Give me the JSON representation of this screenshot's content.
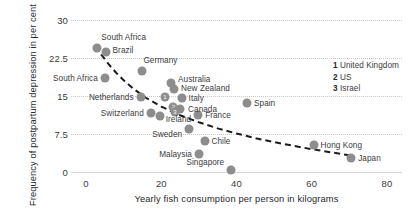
{
  "chart_data": {
    "type": "scatter",
    "title": "",
    "xlabel": "Yearly fish consumption per person in kilograms",
    "ylabel": "Frequency of postpartum depression in per cent",
    "xlim": [
      -4,
      84
    ],
    "ylim": [
      0,
      30
    ],
    "xticks": [
      "0",
      "20",
      "40",
      "60",
      "80"
    ],
    "xtick_values": [
      0,
      20,
      40,
      60,
      80
    ],
    "yticks": [
      "0",
      "7.5",
      "15",
      "22.5",
      "30"
    ],
    "ytick_values": [
      0,
      7.5,
      15,
      22.5,
      30
    ],
    "grid": true,
    "legend_position": "right",
    "points": [
      {
        "label": "South Africa",
        "x": 3.0,
        "y": 24.5,
        "label_side": "right",
        "label_dx": 4,
        "label_dy": -11
      },
      {
        "label": "Brazil",
        "x": 5.2,
        "y": 23.6,
        "label_side": "right",
        "label_dx": 7,
        "label_dy": -2
      },
      {
        "label": "South Africa",
        "x": 5.0,
        "y": 18.6,
        "label_side": "left",
        "label_dx": -7,
        "label_dy": 0
      },
      {
        "label": "Germany",
        "x": 15.0,
        "y": 20.0,
        "label_side": "right",
        "label_dx": 1,
        "label_dy": -11
      },
      {
        "label": "Netherlands",
        "x": 14.5,
        "y": 14.8,
        "label_side": "left",
        "label_dx": -7,
        "label_dy": 0
      },
      {
        "label": "Switzerland",
        "x": 17.2,
        "y": 11.6,
        "label_side": "left",
        "label_dx": -7,
        "label_dy": 0
      },
      {
        "label": "Ireland",
        "x": 19.6,
        "y": 11.0,
        "label_side": "right",
        "label_dx": 6,
        "label_dy": 3
      },
      {
        "label": "Australia",
        "x": 22.6,
        "y": 17.6,
        "label_side": "right",
        "label_dx": 7,
        "label_dy": -4
      },
      {
        "label": "New Zealand",
        "x": 23.4,
        "y": 16.4,
        "label_side": "right",
        "label_dx": 7,
        "label_dy": -1
      },
      {
        "label": "Italy",
        "x": 25.4,
        "y": 14.7,
        "label_side": "right",
        "label_dx": 7,
        "label_dy": 0
      },
      {
        "label": "Canada",
        "x": 25.0,
        "y": 12.4,
        "label_side": "right",
        "label_dx": 8,
        "label_dy": 0
      },
      {
        "label": "France",
        "x": 29.8,
        "y": 11.2,
        "label_side": "right",
        "label_dx": 7,
        "label_dy": 0
      },
      {
        "label": "Sweden",
        "x": 27.4,
        "y": 8.4,
        "label_side": "left",
        "label_dx": -7,
        "label_dy": 5
      },
      {
        "label": "Chile",
        "x": 31.5,
        "y": 6.2,
        "label_side": "right",
        "label_dx": 7,
        "label_dy": 0
      },
      {
        "label": "Malaysia",
        "x": 30.0,
        "y": 3.6,
        "label_side": "left",
        "label_dx": -7,
        "label_dy": 0
      },
      {
        "label": "Singapore",
        "x": 38.6,
        "y": 0.3,
        "label_side": "left",
        "label_dx": -7,
        "label_dy": -8
      },
      {
        "label": "Spain",
        "x": 42.8,
        "y": 13.6,
        "label_side": "right",
        "label_dx": 7,
        "label_dy": 0
      },
      {
        "label": "Hong Kong",
        "x": 60.5,
        "y": 5.4,
        "label_side": "right",
        "label_dx": 7,
        "label_dy": 0
      },
      {
        "label": "Japan",
        "x": 70.5,
        "y": 2.7,
        "label_side": "right",
        "label_dx": 7,
        "label_dy": 0
      }
    ],
    "numbered_points": [
      {
        "number": "1",
        "x": 21.0,
        "y": 14.8
      },
      {
        "number": "2",
        "x": 23.2,
        "y": 12.9
      },
      {
        "number": "3",
        "x": 23.6,
        "y": 11.8
      }
    ],
    "trend_curve": {
      "style": "dashed",
      "color": "#1c1c1c",
      "points": [
        [
          4.0,
          23.2
        ],
        [
          6.0,
          21.3
        ],
        [
          8.0,
          19.6
        ],
        [
          10.0,
          18.1
        ],
        [
          13.0,
          16.2
        ],
        [
          16.0,
          14.6
        ],
        [
          20.0,
          12.9
        ],
        [
          25.0,
          11.2
        ],
        [
          30.0,
          9.8
        ],
        [
          35.0,
          8.6
        ],
        [
          40.0,
          7.6
        ],
        [
          45.0,
          6.7
        ],
        [
          50.0,
          5.9
        ],
        [
          55.0,
          5.2
        ],
        [
          60.0,
          4.5
        ],
        [
          65.0,
          3.9
        ],
        [
          70.0,
          3.3
        ]
      ]
    },
    "legend": [
      {
        "number": "1",
        "label": "United Kingdom"
      },
      {
        "number": "2",
        "label": "US"
      },
      {
        "number": "3",
        "label": "Israel"
      }
    ],
    "colors": {
      "marker": "#8d8d8d",
      "grid": "#c9c9c9",
      "trend": "#1c1c1c",
      "text": "#3b3b3b"
    }
  }
}
